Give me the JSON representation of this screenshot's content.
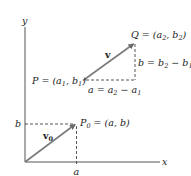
{
  "axes": {
    "x_label": "x",
    "y_label": "y"
  },
  "ticks": {
    "x_tick_label": "a",
    "y_tick_label": "b"
  },
  "vectors": {
    "v0": {
      "label": "v",
      "subscript": "0"
    },
    "v": {
      "label": "v"
    }
  },
  "points": {
    "P0": {
      "prefix": "P",
      "subscript": "0",
      "rest": " = (a, b)"
    },
    "P": {
      "text": "P = (a",
      "sub1": "1",
      "mid": ", b",
      "sub2": "1",
      "end": ")"
    },
    "Q": {
      "text": "Q = (a",
      "sub1": "2",
      "mid": ", b",
      "sub2": "2",
      "end": ")"
    }
  },
  "components": {
    "horizontal": {
      "text": "a = a",
      "sub1": "2",
      "mid": " − a",
      "sub2": "1"
    },
    "vertical": {
      "text": "b = b",
      "sub1": "2",
      "mid": " − b",
      "sub2": "1"
    }
  },
  "colors": {
    "axis": "#555555",
    "arrow": "#7a7a7a",
    "dashed": "#444444",
    "text": "#222222"
  }
}
